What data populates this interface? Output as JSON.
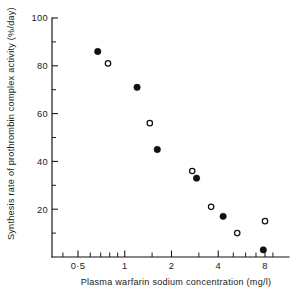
{
  "chart_data": {
    "type": "scatter",
    "title": "",
    "xlabel": "Plasma warfarin sodium  concentration (mg/l)",
    "ylabel": "Synthesis rate of prothrombin complex activity (%/day)",
    "x_scale": "log",
    "y_scale": "linear",
    "xlim": [
      0.36,
      9.9
    ],
    "ylim": [
      0,
      100
    ],
    "grid": false,
    "legend": "none",
    "x_ticks_labeled": [
      {
        "value": 0.5,
        "label": "0·5"
      },
      {
        "value": 1,
        "label": "1"
      },
      {
        "value": 2,
        "label": "2"
      },
      {
        "value": 4,
        "label": "4"
      },
      {
        "value": 8,
        "label": "8"
      }
    ],
    "x_ticks_minor": [
      0.4,
      0.6,
      0.7,
      0.8,
      0.9,
      1.5,
      3,
      5,
      6,
      7,
      9
    ],
    "y_ticks_labeled": [
      {
        "value": 100,
        "label": "100"
      },
      {
        "value": 80,
        "label": "80"
      },
      {
        "value": 60,
        "label": "60"
      },
      {
        "value": 40,
        "label": "40"
      },
      {
        "value": 20,
        "label": "20"
      }
    ],
    "y_ticks_minor": [
      90,
      70,
      50,
      30,
      10
    ],
    "series": [
      {
        "name": "filled-circles",
        "marker": "filled-circle",
        "color": "#111111",
        "points": [
          {
            "x": 0.67,
            "y": 86
          },
          {
            "x": 1.2,
            "y": 71
          },
          {
            "x": 1.62,
            "y": 45
          },
          {
            "x": 2.9,
            "y": 33
          },
          {
            "x": 4.3,
            "y": 17
          },
          {
            "x": 7.8,
            "y": 3
          }
        ]
      },
      {
        "name": "open-circles",
        "marker": "open-circle",
        "color": "#111111",
        "points": [
          {
            "x": 0.78,
            "y": 81
          },
          {
            "x": 1.45,
            "y": 56
          },
          {
            "x": 2.72,
            "y": 36
          },
          {
            "x": 3.6,
            "y": 21
          },
          {
            "x": 5.3,
            "y": 10
          },
          {
            "x": 8.0,
            "y": 15
          }
        ]
      }
    ]
  }
}
